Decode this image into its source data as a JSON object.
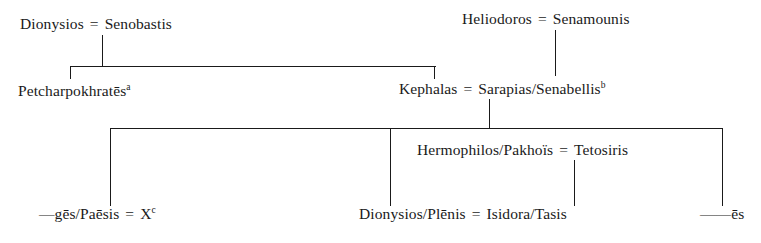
{
  "figure": {
    "type": "genealogical-stemma",
    "background_color": "#ffffff",
    "line_color": "#1a1a1a"
  },
  "generations": {
    "g1": {
      "left_union": {
        "husband": "Dionysios",
        "marriage_symbol": "=",
        "wife": "Senobastis"
      },
      "right_union": {
        "husband": "Heliodoros",
        "marriage_symbol": "=",
        "wife": "Senamounis"
      }
    },
    "g2": {
      "left_child": {
        "name": "Petcharpokhratēs",
        "note": "a"
      },
      "right_union": {
        "husband": "Kephalas",
        "marriage_symbol": "=",
        "wife": "Sarapias/Senabellis",
        "note": "b"
      }
    },
    "g3": {
      "left_union": {
        "lead_dash": "—",
        "husband": "gēs/Paēsis",
        "marriage_symbol": "=",
        "wife": "X",
        "note": "c"
      },
      "middle_union": {
        "husband": "Hermophilos/Pakhoïs",
        "marriage_symbol": "=",
        "wife": "Tetosiris"
      },
      "right_child": {
        "lead_dash": "——",
        "name": "ēs"
      }
    },
    "g4": {
      "union": {
        "husband": "Dionysios/Plēnis",
        "marriage_symbol": "=",
        "wife": "Isidora/Tasis"
      }
    }
  }
}
